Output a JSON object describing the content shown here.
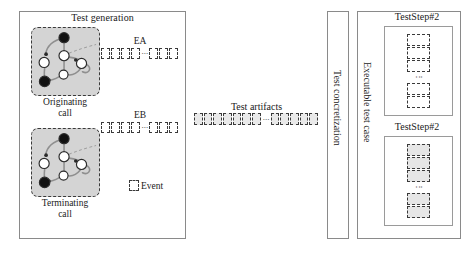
{
  "test_generation": {
    "title": "Test generation",
    "originating_call_label": "Originating\ncall",
    "terminating_call_label": "Terminating\ncall",
    "state_machines": [
      {
        "name": "originating-call-state-machine",
        "caption": "Originating call"
      },
      {
        "name": "terminating-call-state-machine",
        "caption": "Terminating call"
      }
    ],
    "event_groups": [
      {
        "id": "EA",
        "title": "EA",
        "left_boxes": 4,
        "right_boxes": 3,
        "ellipsis": "..."
      },
      {
        "id": "EB",
        "title": "EB",
        "left_boxes": 4,
        "right_boxes": 3,
        "ellipsis": "..."
      }
    ],
    "legend": {
      "box_label": "Event"
    }
  },
  "test_artifacts": {
    "title": "Test artifacts",
    "left_boxes": 7,
    "right_boxes": 5,
    "ellipsis": "..."
  },
  "test_concretization": {
    "label": "Test concretization"
  },
  "executable_test_case": {
    "label": "Executable test case",
    "steps": [
      {
        "title": "TestStep#2",
        "boxes_top": 3,
        "boxes_bottom": 2,
        "ellipsis": "⋮",
        "shaded": false
      },
      {
        "title": "TestStep#2",
        "boxes_top": 3,
        "boxes_bottom": 2,
        "ellipsis": "⋮",
        "shaded": true
      }
    ]
  },
  "colors": {
    "panel_border": "#8a8a8a",
    "state_machine_fill": "#d4d4d4",
    "dashed_stroke": "#3a3a3a",
    "node_dark": "#1a1a1a",
    "node_light": "#ffffff",
    "shaded_box": "#e6e6e6",
    "background": "#ffffff"
  }
}
